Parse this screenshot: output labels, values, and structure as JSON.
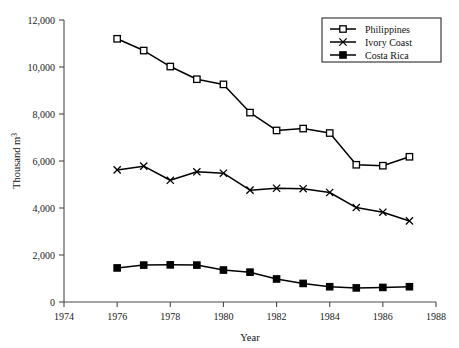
{
  "chart_data": {
    "type": "line",
    "title": "",
    "subtitle": "",
    "xlabel": "Year",
    "ylabel": "Thousand m³",
    "xlim": [
      1974,
      1988
    ],
    "ylim": [
      0,
      12000
    ],
    "xticks": [
      1974,
      1976,
      1978,
      1980,
      1982,
      1984,
      1986,
      1988
    ],
    "xtick_labels": [
      "1974",
      "1976",
      "1978",
      "1980",
      "1982",
      "1984",
      "1986",
      "1988"
    ],
    "yticks": [
      0,
      2000,
      4000,
      6000,
      8000,
      10000,
      12000
    ],
    "ytick_labels": [
      "0",
      "2,000",
      "4,000",
      "6,000",
      "8,000",
      "10,000",
      "12,000"
    ],
    "grid": false,
    "legend_position": "top-right",
    "x": [
      1976,
      1977,
      1978,
      1979,
      1980,
      1981,
      1982,
      1983,
      1984,
      1985,
      1986,
      1987
    ],
    "series": [
      {
        "name": "Philippines",
        "marker": "open-square",
        "values": [
          11200,
          10700,
          10020,
          9480,
          9260,
          8060,
          7300,
          7380,
          7190,
          5840,
          5800,
          6180
        ]
      },
      {
        "name": "Ivory Coast",
        "marker": "cross",
        "values": [
          5620,
          5780,
          5180,
          5540,
          5480,
          4760,
          4840,
          4820,
          4660,
          4020,
          3820,
          3450
        ]
      },
      {
        "name": "Costa Rica",
        "marker": "filled-square",
        "values": [
          1450,
          1570,
          1580,
          1570,
          1360,
          1270,
          980,
          790,
          650,
          600,
          620,
          650
        ]
      }
    ]
  },
  "legend": {
    "items": [
      {
        "label": "Philippines",
        "marker": "open-square"
      },
      {
        "label": "Ivory Coast",
        "marker": "cross"
      },
      {
        "label": "Costa Rica",
        "marker": "filled-square"
      }
    ]
  },
  "colors": {
    "line": "#000000",
    "axis": "#4a4a4a",
    "text": "#111111",
    "background": "#ffffff"
  }
}
